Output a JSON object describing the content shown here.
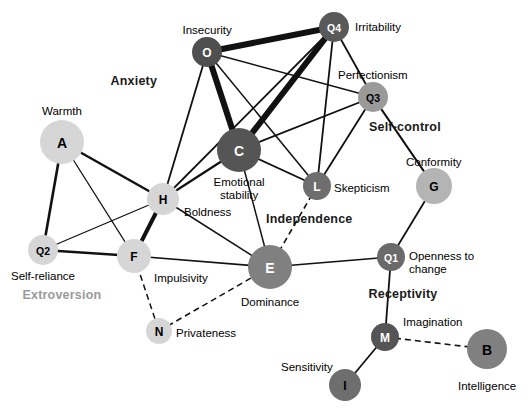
{
  "figure": {
    "type": "network-diagram",
    "title": "",
    "copyright": "© Cengage Learning 2013",
    "background": "#ffffff",
    "width": 530,
    "height": 420
  },
  "chart_data": {
    "type": "network",
    "title": "",
    "nodes": [
      {
        "id": "A",
        "label": "A",
        "trait": "Warmth",
        "x": 62,
        "y": 142,
        "r": 22,
        "fill": "#d6d6d6",
        "text": "#000000",
        "label_x": 62,
        "label_y": 105,
        "align": "center"
      },
      {
        "id": "O",
        "label": "O",
        "trait": "Insecurity",
        "x": 207,
        "y": 52,
        "r": 15,
        "fill": "#4f4f4f",
        "text": "#ffffff",
        "label_x": 207,
        "label_y": 24,
        "align": "center"
      },
      {
        "id": "Q4",
        "label": "Q4",
        "trait": "Irritability",
        "x": 334,
        "y": 27,
        "r": 15,
        "fill": "#595959",
        "text": "#ffffff",
        "label_x": 355,
        "label_y": 21,
        "align": "left"
      },
      {
        "id": "Q3",
        "label": "Q3",
        "trait": "Perfectionism",
        "x": 373,
        "y": 97,
        "r": 15,
        "fill": "#9a9a9a",
        "text": "#000000",
        "label_x": 373,
        "label_y": 69,
        "align": "center"
      },
      {
        "id": "C",
        "label": "C",
        "trait": "Emotional\nstability",
        "x": 239,
        "y": 150,
        "r": 22,
        "fill": "#555555",
        "text": "#ffffff",
        "label_x": 239,
        "label_y": 176,
        "align": "center"
      },
      {
        "id": "H",
        "label": "H",
        "trait": "Boldness",
        "x": 163,
        "y": 199,
        "r": 16,
        "fill": "#d6d6d6",
        "text": "#000000",
        "label_x": 184,
        "label_y": 206,
        "align": "left"
      },
      {
        "id": "L",
        "label": "L",
        "trait": "Skepticism",
        "x": 317,
        "y": 186,
        "r": 14,
        "fill": "#6e6e6e",
        "text": "#ffffff",
        "label_x": 334,
        "label_y": 182,
        "align": "left"
      },
      {
        "id": "G",
        "label": "G",
        "trait": "Conformity",
        "x": 434,
        "y": 186,
        "r": 18,
        "fill": "#b4b4b4",
        "text": "#000000",
        "label_x": 434,
        "label_y": 156,
        "align": "center"
      },
      {
        "id": "Q2",
        "label": "Q2",
        "trait": "Self-reliance",
        "x": 43,
        "y": 250,
        "r": 15,
        "fill": "#d6d6d6",
        "text": "#000000",
        "label_x": 43,
        "label_y": 270,
        "align": "center"
      },
      {
        "id": "F",
        "label": "F",
        "trait": "Impulsivity",
        "x": 134,
        "y": 256,
        "r": 17,
        "fill": "#d6d6d6",
        "text": "#000000",
        "label_x": 154,
        "label_y": 272,
        "align": "left"
      },
      {
        "id": "E",
        "label": "E",
        "trait": "Dominance",
        "x": 270,
        "y": 267,
        "r": 22,
        "fill": "#808080",
        "text": "#ffffff",
        "label_x": 270,
        "label_y": 296,
        "align": "center"
      },
      {
        "id": "Q1",
        "label": "Q1",
        "trait": "Openness to\nchange",
        "x": 391,
        "y": 257,
        "r": 14,
        "fill": "#6a6a6a",
        "text": "#ffffff",
        "label_x": 409,
        "label_y": 250,
        "align": "left"
      },
      {
        "id": "N",
        "label": "N",
        "trait": "Privateness",
        "x": 159,
        "y": 331,
        "r": 13,
        "fill": "#d6d6d6",
        "text": "#000000",
        "label_x": 176,
        "label_y": 327,
        "align": "left"
      },
      {
        "id": "M",
        "label": "M",
        "trait": "Imagination",
        "x": 385,
        "y": 337,
        "r": 14,
        "fill": "#555555",
        "text": "#ffffff",
        "label_x": 403,
        "label_y": 316,
        "align": "left"
      },
      {
        "id": "B",
        "label": "B",
        "trait": "Intelligence",
        "x": 487,
        "y": 349,
        "r": 20,
        "fill": "#808080",
        "text": "#000000",
        "label_x": 487,
        "label_y": 380,
        "align": "center"
      },
      {
        "id": "I",
        "label": "I",
        "trait": "Sensitivity",
        "x": 345,
        "y": 385,
        "r": 16,
        "fill": "#6e6e6e",
        "text": "#000000",
        "label_x": 333,
        "label_y": 361,
        "align": "right"
      }
    ],
    "edges": [
      {
        "from": "O",
        "to": "Q4",
        "width": 6,
        "style": "solid"
      },
      {
        "from": "O",
        "to": "C",
        "width": 6,
        "style": "solid"
      },
      {
        "from": "O",
        "to": "Q3",
        "width": 1.5,
        "style": "solid"
      },
      {
        "from": "O",
        "to": "L",
        "width": 1.5,
        "style": "solid"
      },
      {
        "from": "O",
        "to": "H",
        "width": 1.8,
        "style": "solid"
      },
      {
        "from": "Q4",
        "to": "C",
        "width": 6,
        "style": "solid"
      },
      {
        "from": "Q4",
        "to": "Q3",
        "width": 1.8,
        "style": "solid"
      },
      {
        "from": "Q4",
        "to": "L",
        "width": 1.8,
        "style": "solid"
      },
      {
        "from": "Q4",
        "to": "H",
        "width": 1.8,
        "style": "solid"
      },
      {
        "from": "Q3",
        "to": "C",
        "width": 1.8,
        "style": "solid"
      },
      {
        "from": "Q3",
        "to": "L",
        "width": 1.8,
        "style": "solid"
      },
      {
        "from": "Q3",
        "to": "G",
        "width": 2.2,
        "style": "solid"
      },
      {
        "from": "C",
        "to": "L",
        "width": 1.8,
        "style": "solid"
      },
      {
        "from": "C",
        "to": "H",
        "width": 2.2,
        "style": "solid"
      },
      {
        "from": "C",
        "to": "E",
        "width": 1.5,
        "style": "solid"
      },
      {
        "from": "L",
        "to": "E",
        "width": 1.6,
        "style": "dashed"
      },
      {
        "from": "G",
        "to": "Q1",
        "width": 1.8,
        "style": "solid"
      },
      {
        "from": "A",
        "to": "H",
        "width": 2.4,
        "style": "solid"
      },
      {
        "from": "A",
        "to": "Q2",
        "width": 2.6,
        "style": "solid"
      },
      {
        "from": "A",
        "to": "F",
        "width": 1.3,
        "style": "solid"
      },
      {
        "from": "Q2",
        "to": "H",
        "width": 1.3,
        "style": "solid"
      },
      {
        "from": "Q2",
        "to": "F",
        "width": 2.4,
        "style": "solid"
      },
      {
        "from": "H",
        "to": "F",
        "width": 4,
        "style": "solid"
      },
      {
        "from": "H",
        "to": "E",
        "width": 1.5,
        "style": "solid"
      },
      {
        "from": "F",
        "to": "E",
        "width": 1.6,
        "style": "solid"
      },
      {
        "from": "F",
        "to": "N",
        "width": 1.5,
        "style": "dashed"
      },
      {
        "from": "N",
        "to": "E",
        "width": 1.5,
        "style": "dashed"
      },
      {
        "from": "E",
        "to": "Q1",
        "width": 1.6,
        "style": "solid"
      },
      {
        "from": "Q1",
        "to": "M",
        "width": 1.8,
        "style": "solid"
      },
      {
        "from": "M",
        "to": "I",
        "width": 1.8,
        "style": "solid"
      },
      {
        "from": "M",
        "to": "B",
        "width": 1.6,
        "style": "dashed"
      }
    ],
    "factors": [
      {
        "name": "Anxiety",
        "x": 134,
        "y": 74,
        "color": "#1a1a1a"
      },
      {
        "name": "Self-control",
        "x": 405,
        "y": 120,
        "color": "#1a1a1a"
      },
      {
        "name": "Independence",
        "x": 309,
        "y": 212,
        "color": "#1a1a1a"
      },
      {
        "name": "Extroversion",
        "x": 62,
        "y": 288,
        "color": "#9a9a9a"
      },
      {
        "name": "Receptivity",
        "x": 403,
        "y": 287,
        "color": "#1a1a1a"
      }
    ],
    "legend": {
      "solid": "solid line = positive correlation",
      "dashed": "dashed line = negative correlation"
    }
  }
}
